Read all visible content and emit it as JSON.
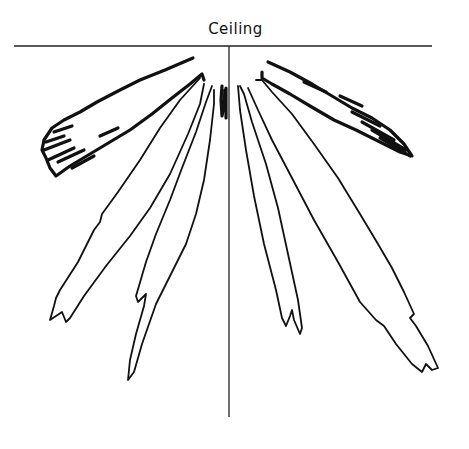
{
  "figure": {
    "label": "Ceiling",
    "colors": {
      "line": "#111111",
      "axis": "#222222",
      "background": "#ffffff"
    },
    "ceiling_line": {
      "x1": 14,
      "y1": 46,
      "x2": 432,
      "y2": 46
    },
    "vertical_axis": {
      "x1": 229,
      "y1": 46,
      "x2": 229,
      "y2": 417
    },
    "lobes": [
      {
        "name": "left-outer-lobe",
        "style": "thick",
        "d": "M193,58 L165,70 L140,80 L120,90 L97,102 L80,112 L64,120 L52,128 L44,140 L42,150 L46,158 L50,168 L56,176 L70,166 L90,154 L110,142 L130,130 L152,114 L172,98 L190,84 L202,74 L204,80"
      },
      {
        "name": "left-outer-lobe-hatch",
        "style": "thick",
        "d": "M54,132 L72,126 M46,142 L64,136 M44,150 L70,140 M48,160 L74,148 M58,162 L84,150 M100,136 L118,128 M72,168 L94,156"
      },
      {
        "name": "left-mid-lobe",
        "style": "thin",
        "d": "M200,78 L180,100 L160,128 L140,160 L118,192 L102,214 L100,222 L94,230 L78,262 L60,290 L56,298 L54,306 L50,320 L56,316 L62,312 L66,322 L70,318 L84,296 L106,266 L130,236 L150,208 L170,174 L188,134 L200,104 L204,84"
      },
      {
        "name": "left-inner-lobe",
        "style": "thin",
        "d": "M212,86 L206,102 L196,132 L182,168 L170,200 L156,234 L146,262 L136,296 L138,302 L146,294 L144,306 L136,334 L130,360 L128,380 L134,372 L142,344 L156,304 L174,268 L186,244 L196,214 L204,180 L210,140 L214,104 L214,90"
      },
      {
        "name": "center-left-spike",
        "style": "thick",
        "d": "M222,86 L221,100 L222,116 L224,104 L225,90 M226,88 L226,118"
      },
      {
        "name": "right-inner-lobe",
        "style": "thin",
        "d": "M238,86 L240,110 L246,150 L254,196 L264,244 L276,290 L282,318 L286,326 L290,316 L292,310 L294,320 L300,334 L302,328 L298,300 L288,254 L278,208 L266,164 L252,122 L244,94 L240,86"
      },
      {
        "name": "right-mid-lobe",
        "style": "thin",
        "d": "M248,88 L258,110 L272,140 L292,178 L314,220 L338,262 L360,302 L376,320 L384,326 L396,344 L412,364 L422,372 L426,364 L432,370 L438,368 L428,346 L416,326 L410,318 L414,314 L404,292 L392,268 L378,244 L360,214 L338,178 L314,144 L292,114 L272,92 L262,80 L256,80"
      },
      {
        "name": "right-outer-lobe",
        "style": "thick",
        "d": "M268,62 L290,72 L312,84 L332,96 L352,108 L372,118 L390,130 L404,144 L412,156 L400,152 L380,142 L356,130 L334,120 L310,106 L290,94 L272,84 L262,78 L262,72"
      },
      {
        "name": "right-outer-lobe-hatch",
        "style": "thick",
        "d": "M352,112 L380,126 M362,122 L394,140 M372,130 L406,150 M380,138 L410,156 M340,96 L362,106 M304,82 L326,92"
      }
    ]
  }
}
